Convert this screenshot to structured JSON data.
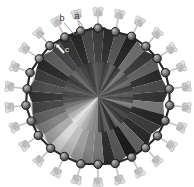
{
  "figure": {
    "background_color": "#ffffff",
    "canvas": {
      "width": 194,
      "height": 187
    },
    "core": {
      "name": "polyhedral-core",
      "center": {
        "x": 98,
        "y": 97
      },
      "radius": 68,
      "facet_count": 36,
      "description": "Radiating triangular facets shaded in grayscale",
      "shade_palette": [
        "#3d3d3d",
        "#2b2b2b",
        "#515151",
        "#1f1f1f",
        "#6a6a6a",
        "#343434",
        "#5c5c5c",
        "#262626",
        "#484848",
        "#303030",
        "#777777",
        "#232323",
        "#3a3a3a",
        "#2a2a2a",
        "#646464",
        "#1c1c1c",
        "#585858",
        "#2f2f2f",
        "#7e7e7e",
        "#8d8d8d",
        "#a8a8a8",
        "#c9c9c9",
        "#e6e6e6",
        "#b4b4b4",
        "#8f8f8f",
        "#6e6e6e",
        "#4d4d4d",
        "#3b3b3b",
        "#555555",
        "#424242",
        "#2d2d2d",
        "#606060",
        "#474747",
        "#353535",
        "#282828",
        "#4a4a4a"
      ],
      "inner_shade_palette": [
        "#4a4a4a",
        "#333333",
        "#5d5d5d",
        "#272727",
        "#757575",
        "#3e3e3e",
        "#686868",
        "#2e2e2e",
        "#545454",
        "#3a3a3a",
        "#828282",
        "#2b2b2b",
        "#454545",
        "#323232",
        "#707070",
        "#242424",
        "#636363",
        "#383838",
        "#8a8a8a",
        "#999999",
        "#b5b5b5",
        "#d6d6d6",
        "#f0f0f0",
        "#c0c0c0",
        "#9b9b9b",
        "#7a7a7a",
        "#585858",
        "#464646",
        "#606060",
        "#4e4e4e",
        "#393939",
        "#6b6b6b",
        "#525252",
        "#404040",
        "#343434",
        "#565656"
      ]
    },
    "rim": {
      "name": "rim-vertex-spheres",
      "count": 26,
      "sphere_radius": 4.2,
      "sphere_fill": "#6f6f6f",
      "sphere_stroke": "#1a1a1a",
      "bond_color": "#262626",
      "ellipse_rx": 72,
      "ellipse_ry": 68
    },
    "ligands": {
      "name": "peripheral-ligand-groups",
      "count": 26,
      "fill": "#d8d8d8",
      "stroke": "#b0b0b0",
      "offset": 17,
      "size": 8
    },
    "labels": [
      {
        "id": "a",
        "text": "a",
        "x": 77,
        "y": 19
      },
      {
        "id": "b",
        "text": "b",
        "x": 62,
        "y": 21
      },
      {
        "id": "c",
        "text": "c",
        "x": 67,
        "y": 52
      }
    ],
    "leaders": [
      {
        "id": "leader-a",
        "x1": 79,
        "y1": 21,
        "x2": 85,
        "y2": 30
      },
      {
        "id": "leader-b",
        "x1": 64,
        "y1": 23,
        "x2": 74,
        "y2": 34
      }
    ],
    "pointer": {
      "id": "pointer-c",
      "color": "#ffffff",
      "tail": {
        "x": 64,
        "y": 53
      },
      "tip": {
        "x": 56,
        "y": 44
      }
    }
  }
}
